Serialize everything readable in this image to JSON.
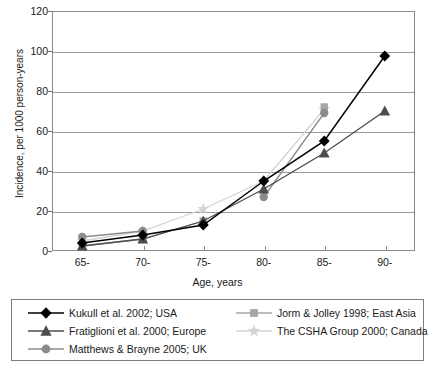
{
  "chart_data": {
    "type": "line",
    "title": "",
    "xlabel": "Age, years",
    "ylabel": "Incidence, per 1000 person-years",
    "categories": [
      "65-",
      "70-",
      "75-",
      "80-",
      "85-",
      "90-"
    ],
    "ylim": [
      0,
      120
    ],
    "yticks": [
      0,
      20,
      40,
      60,
      80,
      100,
      120
    ],
    "grid": true,
    "legend_position": "bottom",
    "series": [
      {
        "name": "Kukull et al. 2002; USA",
        "marker": "diamond",
        "color": "#000000",
        "values": [
          4,
          8,
          13,
          35,
          55,
          97.5
        ]
      },
      {
        "name": "Fratiglioni et al. 2000; Europe",
        "marker": "triangle",
        "color": "#4d4d4d",
        "values": [
          2.5,
          6,
          15,
          31,
          49,
          70
        ]
      },
      {
        "name": "Matthews & Brayne 2005; UK",
        "marker": "circle",
        "color": "#8c8c8c",
        "values": [
          7,
          10,
          null,
          27,
          69,
          null
        ]
      },
      {
        "name": "Jorm & Jolley 1998; East Asia",
        "marker": "square",
        "color": "#a6a6a6",
        "values": [
          2.5,
          6,
          15,
          null,
          72,
          null
        ]
      },
      {
        "name": "The CSHA Group 2000; Canada",
        "marker": "star",
        "color": "#d4d4d4",
        "values": [
          5,
          10,
          21,
          35,
          71,
          null
        ]
      }
    ]
  },
  "axis": {
    "ylabel": "Incidence, per 1000 person-years",
    "xlabel": "Age, years",
    "yticks": [
      "120",
      "100",
      "80",
      "60",
      "40",
      "20",
      "0"
    ],
    "xticks": [
      "65-",
      "70-",
      "75-",
      "80-",
      "85-",
      "90-"
    ]
  },
  "legend": {
    "left": [
      "Kukull et al. 2002; USA",
      "Fratiglioni et al. 2000; Europe",
      "Matthews & Brayne 2005; UK"
    ],
    "right": [
      "Jorm & Jolley 1998; East Asia",
      "The CSHA Group 2000; Canada"
    ]
  }
}
